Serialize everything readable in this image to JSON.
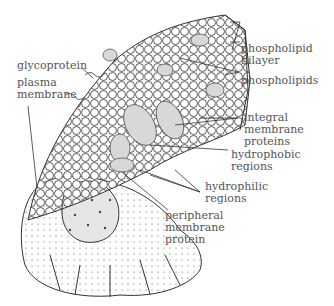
{
  "diagram": {
    "labels": {
      "glycoprotein": "glycoprotein",
      "plasma_membrane_1": "plasma",
      "plasma_membrane_2": "membrane",
      "phospholipid_bilayer_1": "phospholipid",
      "phospholipid_bilayer_2": "bilayer",
      "phospholipids": "phospholipids",
      "integral_1": "integral",
      "integral_2": "membrane",
      "integral_3": "proteins",
      "hydrophobic_1": "hydrophobic",
      "hydrophobic_2": "regions",
      "hydrophilic_1": "hydrophilic",
      "hydrophilic_2": "regions",
      "peripheral_1": "peripheral",
      "peripheral_2": "membrane",
      "peripheral_3": "protein"
    },
    "colors": {
      "line": "#333333",
      "text": "#555555",
      "protein_fill": "#d8d8d8"
    }
  }
}
